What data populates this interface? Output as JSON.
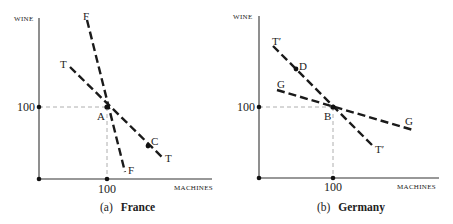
{
  "panels": [
    {
      "id": "france",
      "caption_prefix": "(a)",
      "caption_name": "France",
      "y_axis_label": "WINE",
      "x_axis_label": "MACHINES",
      "y_tick": "100",
      "x_tick": "100",
      "points": [
        {
          "label": "A",
          "desc": "intersection at (100,100)"
        },
        {
          "label": "C",
          "desc": "point on line T"
        }
      ],
      "lines": [
        {
          "label_start": "F",
          "label_end": "F"
        },
        {
          "label_start": "T",
          "label_end": "T"
        }
      ]
    },
    {
      "id": "germany",
      "caption_prefix": "(b)",
      "caption_name": "Germany",
      "y_axis_label": "WINE",
      "x_axis_label": "MACHINES",
      "y_tick": "100",
      "x_tick": "100",
      "points": [
        {
          "label": "B",
          "desc": "intersection at (100,100)"
        },
        {
          "label": "D",
          "desc": "point on line T′"
        }
      ],
      "lines": [
        {
          "label_start": "T′",
          "label_end": "T′"
        },
        {
          "label_start": "G",
          "label_end": "G"
        }
      ]
    }
  ],
  "colors": {
    "ink": "#1a1a1a",
    "guide": "#999999",
    "background": "#ffffff"
  }
}
